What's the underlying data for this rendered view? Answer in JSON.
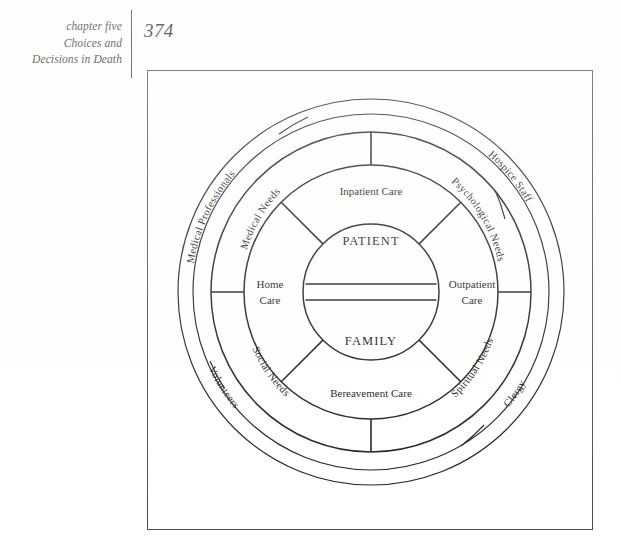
{
  "page": {
    "folio": "374",
    "running_head_lines": [
      "chapter five",
      "Choices and",
      "Decisions in Death"
    ]
  },
  "figure": {
    "core": {
      "top_label": "PATIENT",
      "bottom_label": "FAMILY"
    },
    "care_sectors": [
      {
        "id": "inpatient",
        "label": "Inpatient Care",
        "position": "top"
      },
      {
        "id": "outpatient",
        "label_line1": "Outpatient",
        "label_line2": "Care",
        "position": "right"
      },
      {
        "id": "bereavement",
        "label": "Bereavement Care",
        "position": "bottom"
      },
      {
        "id": "home",
        "label_line1": "Home",
        "label_line2": "Care",
        "position": "left"
      }
    ],
    "needs_ring": [
      {
        "id": "medical-needs",
        "label": "Medical Needs"
      },
      {
        "id": "psychological-needs",
        "label": "Psychological Needs"
      },
      {
        "id": "spiritual-needs",
        "label": "Spiritual Needs"
      },
      {
        "id": "social-needs",
        "label": "Social Needs"
      }
    ],
    "providers_ring": [
      {
        "id": "medical-professionals",
        "label": "Medical Professionals"
      },
      {
        "id": "hospice-staff",
        "label": "Hospice Staff"
      },
      {
        "id": "clergy",
        "label": "Clergy"
      },
      {
        "id": "volunteers",
        "label": "Volunteers"
      }
    ],
    "colors": {
      "ink": "#1d1d1d",
      "frame": "#4a4a4a",
      "paper": "#ffffff"
    }
  }
}
